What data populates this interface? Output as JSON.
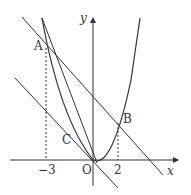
{
  "diagram": {
    "axes": {
      "x_label": "x",
      "y_label": "y",
      "origin_label": "O"
    },
    "points": [
      {
        "name": "A",
        "x": -3
      },
      {
        "name": "B",
        "x": 2
      },
      {
        "name": "C"
      }
    ],
    "ticks": {
      "neg3": "−3",
      "pos2": "2"
    },
    "elements": [
      "parabola through O, A, B",
      "line AB",
      "line through O parallel to AB",
      "line through A tangent at C",
      "tangent line through O (steep)"
    ]
  },
  "colors": {
    "stroke": "#333333",
    "background": "#ffffff"
  }
}
